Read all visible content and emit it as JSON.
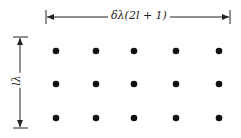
{
  "diagram": {
    "type": "dot-grid-with-dimensions",
    "width_label": "δλ(2l + 1)",
    "height_label": "lλ",
    "rows": 3,
    "columns": 5,
    "dot_color": "#111111",
    "line_color": "#222222",
    "columns_x": [
      56,
      96,
      134,
      176,
      219
    ],
    "rows_y": [
      51,
      84,
      118
    ]
  }
}
